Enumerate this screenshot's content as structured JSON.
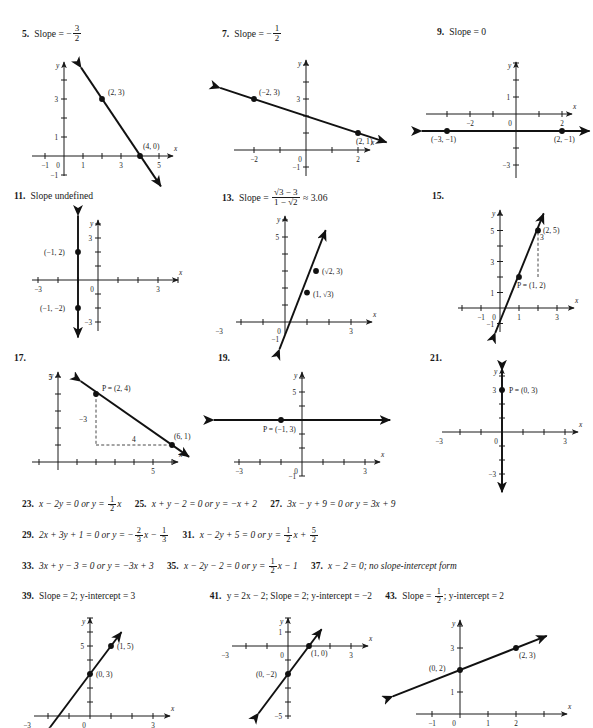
{
  "page": {
    "kind": "textbook-answer-key",
    "width": 593,
    "height": 728
  },
  "headers": [
    {
      "num": "5.",
      "label": "Slope =",
      "sign": "−",
      "frac_num": "3",
      "frac_den": "2"
    },
    {
      "num": "7.",
      "label": "Slope =",
      "sign": "−",
      "frac_num": "1",
      "frac_den": "2"
    },
    {
      "num": "9.",
      "label": "Slope = 0"
    },
    {
      "num": "11.",
      "label": "Slope undefined"
    },
    {
      "num": "13.",
      "label": "Slope  =",
      "frac_num": "√3 − 3",
      "frac_den": "1 − √2",
      "tail": "≈ 3.06"
    },
    {
      "num": "15.",
      "label": ""
    },
    {
      "num": "17.",
      "label": ""
    },
    {
      "num": "19.",
      "label": ""
    },
    {
      "num": "21.",
      "label": ""
    }
  ],
  "answer_rows": [
    {
      "items": [
        {
          "num": "23.",
          "text": "x − 2y = 0 or y = ",
          "frac_num": "1",
          "frac_den": "2",
          "tail": "x"
        },
        {
          "num": "25.",
          "text": "x + y − 2 = 0 or y = −x + 2"
        },
        {
          "num": "27.",
          "text": "3x − y + 9 = 0 or y = 3x + 9"
        }
      ]
    },
    {
      "items": [
        {
          "num": "29.",
          "text": "2x + 3y + 1 = 0 or y = −",
          "frac_num": "2",
          "frac_den": "3",
          "tail": "x − ",
          "frac2_num": "1",
          "frac2_den": "3"
        },
        {
          "num": "31.",
          "text": "x − 2y + 5 = 0 or y = ",
          "frac_num": "1",
          "frac_den": "2",
          "tail": "x + ",
          "frac2_num": "5",
          "frac2_den": "2"
        }
      ]
    },
    {
      "items": [
        {
          "num": "33.",
          "text": "3x + y − 3 = 0 or y = −3x + 3"
        },
        {
          "num": "35.",
          "text": "x − 2y − 2 = 0 or y = ",
          "frac_num": "1",
          "frac_den": "2",
          "tail": "x − 1"
        },
        {
          "num": "37.",
          "text": "x − 2 = 0; no slope-intercept form"
        }
      ]
    },
    {
      "items": [
        {
          "num": "39.",
          "text": "Slope = 2; y-intercept = 3"
        },
        {
          "num": "41.",
          "text": "y = 2x − 2; Slope = 2; y-intercept = −2"
        },
        {
          "num": "43.",
          "text": "Slope = ",
          "frac_num": "1",
          "frac_den": "2",
          "tail": "; y-intercept = 2"
        }
      ]
    }
  ],
  "graphs": [
    {
      "id": "graph-5",
      "axis_label_x": "x",
      "axis_label_y": "y",
      "xticks": [
        {
          "v": -1,
          "label": "−1"
        },
        {
          "v": 1,
          "label": "1"
        },
        {
          "v": 3,
          "label": "3"
        },
        {
          "v": 5,
          "label": "5"
        }
      ],
      "yticks": [
        {
          "v": -1,
          "label": "−1"
        },
        {
          "v": 1,
          "label": "1"
        },
        {
          "v": 3,
          "label": "3"
        }
      ],
      "origin_label": "0",
      "line": {
        "from": [
          0.9,
          4.65
        ],
        "to": [
          5.1,
          -1.6
        ]
      },
      "points": [
        {
          "x": 2,
          "y": 3,
          "label": "(2, 3)",
          "dx": 6,
          "dy": -4
        },
        {
          "x": 4,
          "y": 0,
          "label": "(4, 0)",
          "dx": 3,
          "dy": -7
        }
      ]
    },
    {
      "id": "graph-7",
      "axis_label_x": "x",
      "axis_label_y": "y",
      "xticks": [
        {
          "v": -2,
          "label": "−2"
        },
        {
          "v": 2,
          "label": "2"
        }
      ],
      "yticks": [
        {
          "v": -1,
          "label": "−1"
        },
        {
          "v": 3,
          "label": "3"
        }
      ],
      "origin_label": "0",
      "line": {
        "from": [
          -3.3,
          3.65
        ],
        "to": [
          3.1,
          0.45
        ]
      },
      "points": [
        {
          "x": -2,
          "y": 3,
          "label": "(−2, 3)",
          "dx": 5,
          "dy": -4
        },
        {
          "x": 2,
          "y": 1,
          "label": "(2, 1)",
          "dx": -2,
          "dy": 11
        }
      ]
    },
    {
      "id": "graph-9",
      "axis_label_x": "x",
      "axis_label_y": "y",
      "xticks": [
        {
          "v": -2,
          "label": "−2"
        },
        {
          "v": 2,
          "label": "2"
        }
      ],
      "yticks": [
        {
          "v": -3,
          "label": "−3"
        },
        {
          "v": 1,
          "label": "1"
        }
      ],
      "origin_label": "0",
      "line": {
        "from": [
          -4.1,
          -1
        ],
        "to": [
          3.2,
          -1
        ]
      },
      "points": [
        {
          "x": -3,
          "y": -1,
          "label": "(−3, −1)",
          "dx": -16,
          "dy": 11
        },
        {
          "x": 2,
          "y": -1,
          "label": "(2, −1)",
          "dx": -8,
          "dy": 11
        }
      ]
    },
    {
      "id": "graph-11",
      "axis_label_x": "x",
      "axis_label_y": "y",
      "xticks": [
        {
          "v": -3,
          "label": "−3"
        },
        {
          "v": 3,
          "label": "3"
        }
      ],
      "yticks": [
        {
          "v": -3,
          "label": "−3"
        },
        {
          "v": 3,
          "label": "3"
        }
      ],
      "origin_label": "0",
      "line": {
        "from": [
          -1,
          4.6
        ],
        "to": [
          -1,
          -4.1
        ]
      },
      "points": [
        {
          "x": -1,
          "y": 2,
          "label": "(−1, 2)",
          "dx": -34,
          "dy": 3
        },
        {
          "x": -1,
          "y": -2,
          "label": "(−1, −2)",
          "dx": -38,
          "dy": 3
        }
      ]
    },
    {
      "id": "graph-13",
      "axis_label_x": "x",
      "axis_label_y": "y",
      "xticks": [
        {
          "v": -3,
          "label": "−3"
        },
        {
          "v": 3,
          "label": "3"
        }
      ],
      "yticks": [
        {
          "v": -1,
          "label": "−1"
        },
        {
          "v": 5,
          "label": "5"
        }
      ],
      "origin_label": "0",
      "line": {
        "from": [
          -0.25,
          -1.6
        ],
        "to": [
          1.85,
          5.4
        ]
      },
      "points": [
        {
          "x": 1.41,
          "y": 3,
          "label": "(√2, 3)",
          "dx": 6,
          "dy": 3
        },
        {
          "x": 1,
          "y": 1.73,
          "label": "(1, √3)",
          "dx": 6,
          "dy": 4
        }
      ]
    },
    {
      "id": "graph-15",
      "axis_label_x": "x",
      "axis_label_y": "y",
      "xticks": [
        {
          "v": -1,
          "label": "−1"
        },
        {
          "v": 1,
          "label": "1"
        },
        {
          "v": 3,
          "label": "3"
        }
      ],
      "yticks": [
        {
          "v": -1,
          "label": "−1"
        },
        {
          "v": 1,
          "label": "1"
        },
        {
          "v": 3,
          "label": "3"
        },
        {
          "v": 5,
          "label": "5"
        }
      ],
      "origin_label": "0",
      "line": {
        "from": [
          -0.25,
          -1.6
        ],
        "to": [
          2.3,
          6.1
        ]
      },
      "points": [
        {
          "x": 2,
          "y": 5,
          "label": "(2, 5)",
          "dx": 5,
          "dy": 2
        },
        {
          "x": 1,
          "y": 2,
          "label": "P = (1, 2)",
          "dx": -2,
          "dy": 11
        }
      ],
      "dashed": {
        "from": [
          2,
          2
        ],
        "to": [
          2,
          5
        ],
        "rise_label": "3",
        "label_dx": 4,
        "label_dy": -14
      }
    },
    {
      "id": "graph-17",
      "axis_label_x": "x",
      "axis_label_y": "y",
      "xticks": [
        {
          "v": 5,
          "label": "5"
        }
      ],
      "yticks": [
        {
          "v": 5,
          "label": "5"
        }
      ],
      "origin_label": "",
      "line": {
        "from": [
          1.2,
          4.75
        ],
        "to": [
          6.9,
          0.3
        ]
      },
      "points": [
        {
          "x": 2,
          "y": 4,
          "label": "P = (2, 4)",
          "dx": 6,
          "dy": -3
        },
        {
          "x": 6,
          "y": 1,
          "label": "(6, 1)",
          "dx": 2,
          "dy": -6
        }
      ],
      "dashed_rise": {
        "from": [
          2,
          4
        ],
        "to": [
          2,
          1
        ],
        "label": "−3",
        "label_dx": -13,
        "label_dy": 2
      },
      "dashed_run": {
        "from": [
          2,
          1
        ],
        "to": [
          6,
          1
        ],
        "label": "4",
        "label_dx": 0,
        "label_dy": -3
      }
    },
    {
      "id": "graph-19",
      "axis_label_x": "x",
      "axis_label_y": "y",
      "xticks": [
        {
          "v": -3,
          "label": "−3"
        },
        {
          "v": 3,
          "label": "3"
        }
      ],
      "yticks": [
        {
          "v": -1,
          "label": "−1"
        },
        {
          "v": 5,
          "label": "5"
        }
      ],
      "origin_label": "0",
      "line": {
        "from": [
          -4.2,
          3
        ],
        "to": [
          4.2,
          3
        ]
      },
      "points": [
        {
          "x": -1,
          "y": 3,
          "label": "P = (−1, 3)",
          "dx": -18,
          "dy": 12
        }
      ]
    },
    {
      "id": "graph-21",
      "axis_label_x": "x",
      "axis_label_y": "y",
      "xticks": [
        {
          "v": -3,
          "label": "−3"
        },
        {
          "v": 3,
          "label": "3"
        }
      ],
      "yticks": [
        {
          "v": -3,
          "label": "−3"
        },
        {
          "v": 3,
          "label": "3"
        }
      ],
      "origin_label": "0",
      "line": {
        "from": [
          0,
          4.4
        ],
        "to": [
          0,
          -4.3
        ]
      },
      "points": [
        {
          "x": 0,
          "y": 3,
          "label": "P = (0, 3)",
          "dx": 7,
          "dy": 3
        }
      ]
    },
    {
      "id": "graph-39",
      "axis_label_x": "x",
      "axis_label_y": "y",
      "xticks": [
        {
          "v": -3,
          "label": "−3"
        },
        {
          "v": 3,
          "label": "3"
        }
      ],
      "yticks": [
        {
          "v": 5,
          "label": "5"
        }
      ],
      "origin_label": "0",
      "line": {
        "from": [
          -1.9,
          -0.8
        ],
        "to": [
          1.5,
          6.0
        ]
      },
      "points": [
        {
          "x": 1,
          "y": 5,
          "label": "(1, 5)",
          "dx": 6,
          "dy": 3
        },
        {
          "x": 0,
          "y": 3,
          "label": "(0, 3)",
          "dx": 6,
          "dy": 3
        }
      ]
    },
    {
      "id": "graph-41",
      "axis_label_x": "x",
      "axis_label_y": "y",
      "xticks": [
        {
          "v": -3,
          "label": "−3"
        },
        {
          "v": 3,
          "label": "3"
        }
      ],
      "yticks": [
        {
          "v": -5,
          "label": "−5"
        },
        {
          "v": 1,
          "label": "1"
        }
      ],
      "origin_label": "0",
      "line": {
        "from": [
          -1.4,
          -4.8
        ],
        "to": [
          1.6,
          1.2
        ]
      },
      "points": [
        {
          "x": 1,
          "y": 0,
          "label": "(1, 0)",
          "dx": 2,
          "dy": 10
        },
        {
          "x": 0,
          "y": -2,
          "label": "(0, −2)",
          "dx": -32,
          "dy": 3
        }
      ]
    },
    {
      "id": "graph-43",
      "axis_label_x": "x",
      "axis_label_y": "y",
      "xticks": [
        {
          "v": -1,
          "label": "−1"
        },
        {
          "v": 1,
          "label": "1"
        },
        {
          "v": 2,
          "label": "2"
        }
      ],
      "yticks": [
        {
          "v": 1,
          "label": "1"
        },
        {
          "v": 3,
          "label": "3"
        }
      ],
      "origin_label": "0",
      "line": {
        "from": [
          -2.4,
          0.8
        ],
        "to": [
          3.1,
          3.55
        ]
      },
      "points": [
        {
          "x": 2,
          "y": 3,
          "label": "(2, 3)",
          "dx": 3,
          "dy": 10
        },
        {
          "x": 0,
          "y": 2,
          "label": "(0, 2)",
          "dx": -31,
          "dy": 1
        }
      ]
    }
  ]
}
